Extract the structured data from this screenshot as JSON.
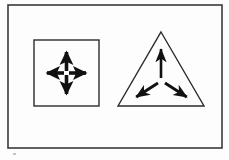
{
  "figure": {
    "title": "Outward-pointing arrows on a square and a triangle",
    "background_color": "#fdfdfd",
    "ink_color": "#111111",
    "border_color": "#3a3a3a",
    "frame": {
      "name": "outer-frame",
      "x": 8,
      "y": 5,
      "width": 214,
      "height": 143,
      "stroke_width": 1.6
    },
    "shapes": [
      {
        "id": "square",
        "label": "square",
        "vertices": 4,
        "arrow_count": 4,
        "x": 34,
        "y": 40,
        "width": 65,
        "height": 66,
        "stroke_width": 1.4,
        "arrows": [
          {
            "name": "arrow-up",
            "direction": "up",
            "angle_deg": 90,
            "tail": [
              66.5,
              71
            ],
            "head": [
              66.5,
              45
            ]
          },
          {
            "name": "arrow-down",
            "direction": "down",
            "angle_deg": 270,
            "tail": [
              66.5,
              75
            ],
            "head": [
              66.5,
              101
            ]
          },
          {
            "name": "arrow-left",
            "direction": "left",
            "angle_deg": 180,
            "tail": [
              64,
              73
            ],
            "head": [
              40,
              73
            ]
          },
          {
            "name": "arrow-right",
            "direction": "right",
            "angle_deg": 0,
            "tail": [
              69,
              73
            ],
            "head": [
              93,
              73
            ]
          }
        ]
      },
      {
        "id": "triangle",
        "label": "triangle",
        "vertices": 3,
        "arrow_count": 3,
        "apex": [
          161,
          32
        ],
        "base_left": [
          118,
          106
        ],
        "base_right": [
          204,
          106
        ],
        "stroke_width": 1.4,
        "arrows": [
          {
            "name": "arrow-up",
            "direction": "up",
            "angle_deg": 90,
            "tail": [
              161,
              78
            ],
            "head": [
              161,
              40
            ]
          },
          {
            "name": "arrow-down-left",
            "direction": "down-left",
            "angle_deg": 210,
            "tail": [
              158,
              83
            ],
            "head": [
              127,
              103
            ]
          },
          {
            "name": "arrow-down-right",
            "direction": "down-right",
            "angle_deg": 330,
            "tail": [
              165,
              83
            ],
            "head": [
              196,
              103
            ]
          }
        ]
      }
    ],
    "artifacts": [
      {
        "name": "scan-speck",
        "x": 13,
        "y": 153,
        "width": 3,
        "height": 2
      }
    ]
  }
}
